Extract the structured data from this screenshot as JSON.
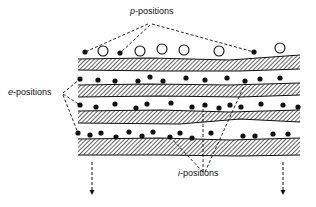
{
  "labels": {
    "p_positions": {
      "prefix": "p",
      "suffix": "-positions",
      "x": 130,
      "y": 12
    },
    "e_positions": {
      "prefix": "e",
      "suffix": "-positions",
      "x": 8,
      "y": 93
    },
    "i_positions": {
      "prefix": "i",
      "suffix": "-positions",
      "x": 178,
      "y": 174
    }
  },
  "colors": {
    "ink": "#111111",
    "background": "#ffffff"
  },
  "layers": [
    {
      "top": [
        [
          78,
          59
        ],
        [
          150,
          58
        ],
        [
          230,
          60
        ],
        [
          300,
          55
        ]
      ],
      "bottom": [
        [
          78,
          70
        ],
        [
          160,
          71
        ],
        [
          240,
          71
        ],
        [
          300,
          69
        ]
      ]
    },
    {
      "top": [
        [
          78,
          85
        ],
        [
          150,
          84
        ],
        [
          230,
          85
        ],
        [
          300,
          83
        ]
      ],
      "bottom": [
        [
          78,
          97
        ],
        [
          160,
          96
        ],
        [
          240,
          97
        ],
        [
          300,
          95
        ]
      ]
    },
    {
      "top": [
        [
          78,
          111
        ],
        [
          160,
          110
        ],
        [
          230,
          112
        ],
        [
          300,
          110
        ]
      ],
      "bottom": [
        [
          78,
          123
        ],
        [
          180,
          124
        ],
        [
          240,
          119
        ],
        [
          300,
          122
        ]
      ]
    },
    {
      "top": [
        [
          78,
          139
        ],
        [
          160,
          138
        ],
        [
          230,
          140
        ],
        [
          300,
          138
        ]
      ],
      "bottom": [
        [
          78,
          155
        ],
        [
          160,
          155
        ],
        [
          240,
          156
        ],
        [
          300,
          155
        ]
      ]
    }
  ],
  "p_dots": [
    [
      85,
      52
    ],
    [
      120,
      53
    ],
    [
      254,
      52
    ]
  ],
  "p_circles": [
    [
      103,
      51
    ],
    [
      140,
      51
    ],
    [
      162,
      49
    ],
    [
      184,
      50
    ],
    [
      219,
      51
    ],
    [
      280,
      48
    ]
  ],
  "gap1_dots": [
    [
      80,
      79
    ],
    [
      98,
      80
    ],
    [
      115,
      81
    ],
    [
      138,
      81
    ],
    [
      150,
      77
    ],
    [
      163,
      81
    ],
    [
      186,
      78
    ],
    [
      205,
      80
    ],
    [
      227,
      78
    ],
    [
      245,
      81
    ],
    [
      260,
      79
    ],
    [
      280,
      78
    ]
  ],
  "gap2_dots": [
    [
      80,
      105
    ],
    [
      96,
      107
    ],
    [
      115,
      104
    ],
    [
      136,
      108
    ],
    [
      147,
      104
    ],
    [
      171,
      103
    ],
    [
      192,
      107
    ],
    [
      205,
      105
    ],
    [
      219,
      108
    ],
    [
      230,
      105
    ],
    [
      241,
      107
    ],
    [
      261,
      104
    ],
    [
      283,
      105
    ],
    [
      298,
      107
    ]
  ],
  "gap3_dots": [
    [
      78,
      133
    ],
    [
      90,
      135
    ],
    [
      101,
      133
    ],
    [
      116,
      137
    ],
    [
      129,
      132
    ],
    [
      142,
      136
    ],
    [
      153,
      132
    ],
    [
      170,
      137
    ],
    [
      180,
      133
    ],
    [
      192,
      138
    ],
    [
      211,
      133
    ],
    [
      243,
      136
    ],
    [
      255,
      136
    ],
    [
      273,
      134
    ],
    [
      288,
      134
    ]
  ],
  "arrows": [
    {
      "x": 92,
      "y1": 162,
      "y2": 195
    },
    {
      "x": 283,
      "y1": 162,
      "y2": 195
    }
  ],
  "leaders": {
    "p": [
      [
        [
          148,
          24
        ],
        [
          85,
          52
        ]
      ],
      [
        [
          150,
          25
        ],
        [
          120,
          53
        ]
      ],
      [
        [
          152,
          24
        ],
        [
          254,
          52
        ]
      ]
    ],
    "e": [
      [
        [
          63,
          93
        ],
        [
          80,
          79
        ]
      ],
      [
        [
          63,
          94
        ],
        [
          80,
          105
        ]
      ],
      [
        [
          63,
          95
        ],
        [
          78,
          133
        ]
      ]
    ],
    "i": [
      [
        [
          203,
          172
        ],
        [
          170,
          137
        ]
      ],
      [
        [
          203,
          172
        ],
        [
          203,
          106
        ]
      ],
      [
        [
          205,
          172
        ],
        [
          244,
          86
        ]
      ]
    ]
  }
}
